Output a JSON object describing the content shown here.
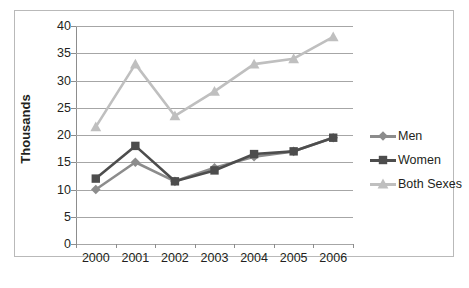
{
  "chart_data": {
    "type": "line",
    "title": "",
    "xlabel": "",
    "ylabel": "Thousands",
    "categories": [
      "2000",
      "2001",
      "2002",
      "2003",
      "2004",
      "2005",
      "2006"
    ],
    "ylim": [
      0,
      40
    ],
    "ytick_step": 5,
    "yticks": [
      "0",
      "5",
      "10",
      "15",
      "20",
      "25",
      "30",
      "35",
      "40"
    ],
    "grid": true,
    "legend_position": "right",
    "series": [
      {
        "name": "Men",
        "color": "#8c8c8c",
        "marker": "diamond",
        "values": [
          10,
          15,
          11.5,
          14,
          16,
          17,
          19.5
        ]
      },
      {
        "name": "Women",
        "color": "#4d4d4d",
        "marker": "square",
        "values": [
          12,
          18,
          11.5,
          13.5,
          16.5,
          17,
          19.5
        ]
      },
      {
        "name": "Both Sexes",
        "color": "#bfbfbf",
        "marker": "triangle",
        "values": [
          21.5,
          33,
          23.5,
          28,
          33,
          34,
          38
        ]
      }
    ]
  },
  "legend": {
    "items": [
      {
        "label": "Men"
      },
      {
        "label": "Women"
      },
      {
        "label": "Both Sexes"
      }
    ]
  },
  "axis": {
    "y_title": "Thousands"
  }
}
